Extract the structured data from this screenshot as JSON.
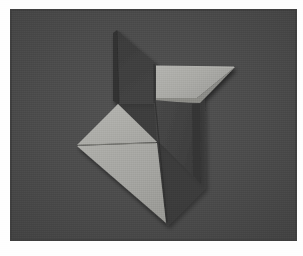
{
  "image": {
    "subject": "origami-shuriken",
    "title": "Folded paper shuriken (ninja star) on gray background",
    "caption": "",
    "width": 303,
    "height": 256,
    "border": {
      "color": "#fefefe",
      "left": 11,
      "top": 10,
      "right": 7,
      "bottom": 16
    },
    "background": {
      "color": "#4a4a4a",
      "edge_shadow_color": "#3f3f3f",
      "highlight_color": "#535353"
    },
    "palette": {
      "paper_dark_main": "#3e3e3e",
      "paper_dark_shadow": "#343434",
      "paper_dark_lower": "#444444",
      "paper_light_main": "#a8a8a4",
      "paper_light_shadow": "#9a9a96",
      "paper_light_highlight": "#b6b6b2",
      "crease_line": "#8d8d89",
      "edge_line": "#2b2b2b"
    },
    "plate": {
      "x": 11,
      "y": 10,
      "width": 285,
      "height": 230
    },
    "shapes": [
      {
        "name": "upper-dark-blade",
        "fill": "paper_dark_main",
        "points": "116,30 153,62 153,104 118,104"
      },
      {
        "name": "upper-dark-blade-edge",
        "fill": "paper_dark_shadow",
        "points": "116,30 118,104 112,101 112,33"
      },
      {
        "name": "right-light-blade",
        "fill": "paper_light_main",
        "points": "155,66 235,67 197,99 155,99"
      },
      {
        "name": "right-light-blade-bevel",
        "fill": "paper_light_shadow",
        "points": "155,99 197,99 235,67 200,102 156,102"
      },
      {
        "name": "lower-dark-blade",
        "fill": "paper_dark_lower",
        "points": "155,99 200,103 201,184 157,139"
      },
      {
        "name": "lower-dark-blade-shadow",
        "fill": "paper_dark_shadow",
        "points": "196,104 201,184 193,176 191,104"
      },
      {
        "name": "left-light-blade-upper",
        "fill": "paper_light_highlight",
        "points": "77,145 118,104 156,143"
      },
      {
        "name": "left-light-blade-lower",
        "fill": "paper_light_main",
        "points": "77,146 156,144 166,223"
      }
    ],
    "creases": [
      {
        "name": "horizontal-crease-left-blade",
        "from": "78,145",
        "to": "155,143"
      },
      {
        "name": "center-vertical-edge",
        "from": "118,104",
        "to": "118,104"
      }
    ],
    "tips": [
      {
        "name": "top-tip",
        "x": 116,
        "y": 30
      },
      {
        "name": "right-tip",
        "x": 235,
        "y": 67
      },
      {
        "name": "bottom-right-tip",
        "x": 201,
        "y": 184
      },
      {
        "name": "bottom-tip",
        "x": 166,
        "y": 223
      },
      {
        "name": "left-tip",
        "x": 77,
        "y": 145
      }
    ],
    "center": {
      "x": 118,
      "y": 104
    }
  }
}
